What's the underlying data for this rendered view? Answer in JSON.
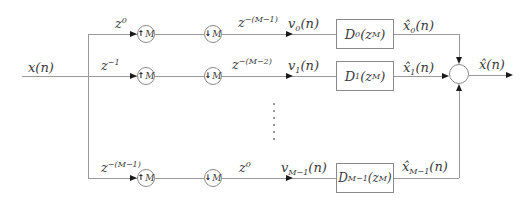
{
  "style": {
    "background": "#ffffff",
    "line_color": "#9a9a9a",
    "text_color": "#3a3a3a",
    "arrow_color": "#1a1a1a"
  },
  "signals": {
    "input_base": "x",
    "input_args": "(n)",
    "output_base": "x̂",
    "output_args": "(n)"
  },
  "rows": [
    {
      "delay_in_base": "z",
      "delay_in_sup": "0",
      "upsampler_arrow": "↑",
      "upsampler_factor": "M",
      "downsampler_arrow": "↓",
      "downsampler_factor": "M",
      "delay_out_base": "z",
      "delay_out_sup": "−(M−1)",
      "v_base": "v",
      "v_sub": "0",
      "v_args": "(n)",
      "filter_base": "D",
      "filter_sub": "0",
      "filter_mid": "(z",
      "filter_sup": "M",
      "filter_close": ")",
      "xhat_base": "x̂",
      "xhat_sub": "0",
      "xhat_args": "(n)"
    },
    {
      "delay_in_base": "z",
      "delay_in_sup": "−1",
      "upsampler_arrow": "↑",
      "upsampler_factor": "M",
      "downsampler_arrow": "↓",
      "downsampler_factor": "M",
      "delay_out_base": "z",
      "delay_out_sup": "−(M−2)",
      "v_base": "v",
      "v_sub": "1",
      "v_args": "(n)",
      "filter_base": "D",
      "filter_sub": "1",
      "filter_mid": "(z",
      "filter_sup": "M",
      "filter_close": ")",
      "xhat_base": "x̂",
      "xhat_sub": "1",
      "xhat_args": "(n)"
    },
    {
      "delay_in_base": "z",
      "delay_in_sup": "−(M−1)",
      "upsampler_arrow": "↑",
      "upsampler_factor": "M",
      "downsampler_arrow": "↓",
      "downsampler_factor": "M",
      "delay_out_base": "z",
      "delay_out_sup": "0",
      "v_base": "v",
      "v_sub": "M−1",
      "v_args": "(n)",
      "filter_base": "D",
      "filter_sub": "M−1",
      "filter_mid": "(z",
      "filter_sup": "M",
      "filter_close": ")",
      "xhat_base": "x̂",
      "xhat_sub": "M−1",
      "xhat_args": "(n)"
    }
  ]
}
